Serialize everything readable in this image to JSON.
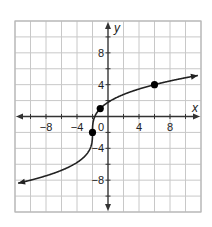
{
  "chart_data": {
    "type": "line",
    "title": "",
    "xlabel": "x",
    "ylabel": "y",
    "xlim": [
      -12,
      12
    ],
    "ylim": [
      -12,
      12
    ],
    "grid": true,
    "grid_step": 2,
    "x_ticks": [
      -8,
      -4,
      0,
      4,
      8
    ],
    "x_tick_labels": [
      "−8",
      "−4",
      "0",
      "4",
      "8"
    ],
    "y_ticks": [
      8,
      4,
      -4,
      -8
    ],
    "y_tick_labels": [
      "8",
      "4",
      "−4",
      "−8"
    ],
    "function": "y = 3·cbrt(x + 2) − 2",
    "curve_domain": [
      -11.6,
      11.6
    ],
    "curve_arrows": true,
    "points": [
      {
        "x": -2,
        "y": -2
      },
      {
        "x": -1,
        "y": 1
      },
      {
        "x": 6,
        "y": 4
      }
    ],
    "series": [
      {
        "name": "curve",
        "x": [
          -11.6,
          -10,
          -8,
          -6,
          -4,
          -3,
          -2.5,
          -2,
          -1.5,
          -1,
          0,
          2,
          4,
          6,
          8,
          10,
          11.6
        ],
        "values": [
          -8.24,
          -7.77,
          -7.46,
          -8.0,
          -5.78,
          -5.0,
          -4.38,
          -2,
          0.38,
          1,
          1.78,
          2.76,
          3.45,
          4,
          4.46,
          4.87,
          5.14
        ]
      }
    ],
    "legend": null
  },
  "labels": {
    "x_axis": "x",
    "y_axis": "y"
  },
  "colors": {
    "grid": "#c8c8c8",
    "axis": "#333333",
    "curve": "#222222",
    "point": "#000000",
    "border": "#b8b8b8"
  }
}
